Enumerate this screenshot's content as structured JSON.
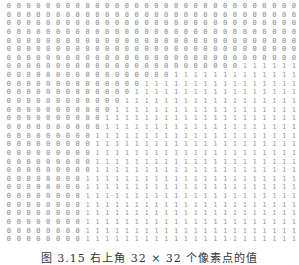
{
  "figure": {
    "caption": "图 3.15   右上角 32 × 32 个像素点的值",
    "grid": {
      "columns": 30,
      "rows": 28,
      "zero_char": "0",
      "one_char": "1",
      "row_first_one_col": [
        30,
        30,
        30,
        30,
        30,
        30,
        30,
        24,
        17,
        14,
        13,
        12,
        11,
        10,
        10,
        9,
        9,
        9,
        9,
        9,
        8,
        8,
        8,
        8,
        8,
        8,
        8,
        8
      ]
    }
  }
}
